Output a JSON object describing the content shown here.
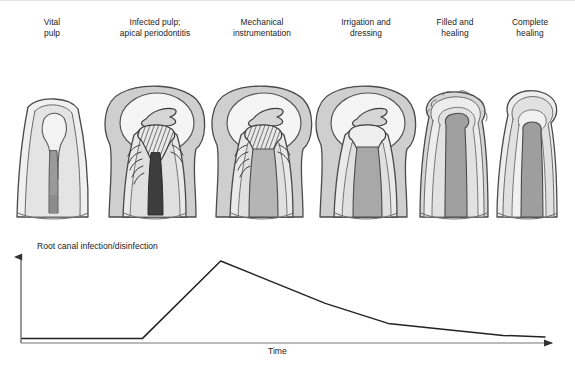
{
  "figure": {
    "background_color": "#ffffff"
  },
  "stages": [
    {
      "id": "vital-pulp",
      "label": "Vital\npulp",
      "center_x": 52,
      "canal_state": "vital pulp",
      "lesion": false
    },
    {
      "id": "infected-pulp",
      "label": "Infected pulp;\napical periodontitis",
      "center_x": 155,
      "canal_state": "necrotic infected pulp",
      "lesion": true
    },
    {
      "id": "mechanical",
      "label": "Mechanical\ninstrumentation",
      "center_x": 262,
      "canal_state": "instrumented canal",
      "lesion": true
    },
    {
      "id": "irrigation",
      "label": "Irrigation and\ndressing",
      "center_x": 366,
      "canal_state": "dressed canal",
      "lesion": true
    },
    {
      "id": "filled-healing",
      "label": "Filled and\nhealing",
      "center_x": 455,
      "canal_state": "root filling",
      "lesion": false
    },
    {
      "id": "complete-healing",
      "label": "Complete\nhealing",
      "center_x": 528,
      "canal_state": "root filling",
      "lesion": false
    }
  ],
  "chart_data": {
    "type": "line",
    "title": "",
    "ylabel": "Root canal infection/disinfection",
    "xlabel": "Time",
    "grid": false,
    "legend": null,
    "axis_arrows": true,
    "xlim": [
      0,
      100
    ],
    "ylim": [
      0,
      100
    ],
    "series": [
      {
        "name": "Root canal infection/disinfection",
        "color": "#222222",
        "points": [
          {
            "x": 0,
            "y": 3,
            "stage": "vital pulp"
          },
          {
            "x": 15,
            "y": 3,
            "stage": "vital pulp"
          },
          {
            "x": 23,
            "y": 3,
            "stage": "infection onset"
          },
          {
            "x": 38,
            "y": 100,
            "stage": "infected pulp; apical periodontitis"
          },
          {
            "x": 58,
            "y": 47,
            "stage": "mechanical instrumentation"
          },
          {
            "x": 70,
            "y": 22,
            "stage": "irrigation and dressing"
          },
          {
            "x": 80,
            "y": 15,
            "stage": "filled and healing"
          },
          {
            "x": 92,
            "y": 7,
            "stage": "complete healing"
          },
          {
            "x": 100,
            "y": 5,
            "stage": "complete healing"
          }
        ]
      }
    ]
  },
  "palette": {
    "outline": "#4a4a4a",
    "enamel": "#f0f0f0",
    "dentin": "#d8d8d8",
    "bone": "#cccccc",
    "lesion": "#f4f4f4",
    "pulp_vital": "#9a9a9a",
    "pulp_infected": "#4a4a4a",
    "canal_instrumented": "#b5b5b5",
    "filling": "#a0a0a0",
    "curve": "#222222",
    "axis": "#555555"
  }
}
